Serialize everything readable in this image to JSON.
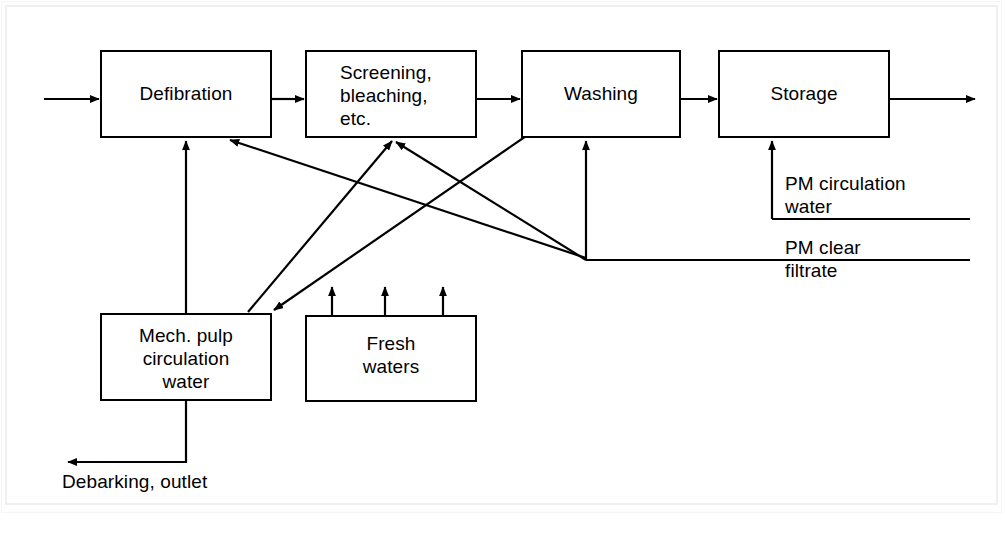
{
  "figure": {
    "stroke_color": "#000000",
    "background_color": "#ffffff"
  },
  "nodes": [
    {
      "id": "defibration",
      "label": "Defibration"
    },
    {
      "id": "screening",
      "label": "Screening,\nbleaching,\netc."
    },
    {
      "id": "washing",
      "label": "Washing"
    },
    {
      "id": "storage",
      "label": "Storage"
    },
    {
      "id": "mech_pulp",
      "label": "Mech. pulp\ncirculation\nwater"
    },
    {
      "id": "fresh_waters",
      "label": "Fresh\nwaters"
    }
  ],
  "wire_labels": [
    {
      "id": "pm_circulation_water",
      "label": "PM circulation\nwater"
    },
    {
      "id": "pm_clear_filtrate",
      "label": "PM clear\nfiltrate"
    },
    {
      "id": "debarking_outlet",
      "label": "Debarking, outlet"
    }
  ],
  "flows": [
    {
      "from": "inlet",
      "to": "defibration",
      "type": "process"
    },
    {
      "from": "defibration",
      "to": "screening",
      "type": "process"
    },
    {
      "from": "screening",
      "to": "washing",
      "type": "process"
    },
    {
      "from": "washing",
      "to": "storage",
      "type": "process"
    },
    {
      "from": "storage",
      "to": "outlet",
      "type": "process"
    },
    {
      "from": "mech_pulp",
      "to": "defibration",
      "type": "recirculation"
    },
    {
      "from": "mech_pulp",
      "to": "screening",
      "type": "recirculation"
    },
    {
      "from": "washing",
      "to": "mech_pulp",
      "type": "recirculation"
    },
    {
      "from": "pm_clear_filtrate",
      "to": "defibration",
      "type": "recirculation"
    },
    {
      "from": "pm_clear_filtrate",
      "to": "screening",
      "type": "recirculation"
    },
    {
      "from": "pm_clear_filtrate",
      "to": "washing",
      "type": "recirculation"
    },
    {
      "from": "pm_circulation_water",
      "to": "storage",
      "type": "recirculation"
    },
    {
      "from": "fresh_waters",
      "to": "process_line",
      "type": "fresh",
      "count": 3
    },
    {
      "from": "mech_pulp",
      "to": "debarking_outlet",
      "type": "effluent"
    }
  ],
  "caption": {
    "text": ""
  }
}
